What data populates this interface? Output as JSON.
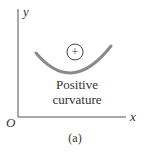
{
  "diagram": {
    "y_axis_label": "y",
    "x_axis_label": "x",
    "origin_label": "O",
    "sign_symbol": "+",
    "curve_label_line1": "Positive",
    "curve_label_line2": "curvature",
    "caption": "(a)",
    "colors": {
      "curve": "#8a8a8a",
      "axes": "#555555",
      "text": "#333333"
    }
  }
}
